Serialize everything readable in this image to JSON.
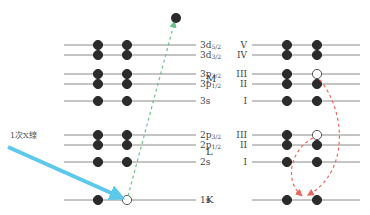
{
  "xray_label": "1次X線",
  "left_levels": [
    {
      "id": "3d52",
      "base": "3d",
      "sub": "5/2",
      "y": 45,
      "electrons": [
        "filled",
        "filled"
      ]
    },
    {
      "id": "3d32",
      "base": "3d",
      "sub": "3/2",
      "y": 55,
      "electrons": [
        "filled",
        "filled"
      ]
    },
    {
      "id": "3p32",
      "base": "3p",
      "sub": "3/2",
      "y": 74,
      "electrons": [
        "filled",
        "filled"
      ]
    },
    {
      "id": "3p12",
      "base": "3p",
      "sub": "1/2",
      "y": 84,
      "electrons": [
        "filled",
        "filled"
      ]
    },
    {
      "id": "3s",
      "base": "3s",
      "sub": "",
      "y": 101,
      "electrons": [
        "filled",
        "filled"
      ]
    },
    {
      "id": "2p32",
      "base": "2p",
      "sub": "3/2",
      "y": 135,
      "electrons": [
        "filled",
        "filled"
      ]
    },
    {
      "id": "2p12",
      "base": "2p",
      "sub": "1/2",
      "y": 145,
      "electrons": [
        "filled",
        "filled"
      ]
    },
    {
      "id": "2s",
      "base": "2s",
      "sub": "",
      "y": 162,
      "electrons": [
        "filled",
        "filled"
      ]
    },
    {
      "id": "1s",
      "base": "1s",
      "sub": "",
      "y": 200,
      "electrons": [
        "filled",
        "hole"
      ]
    }
  ],
  "shells": [
    {
      "label": "M",
      "y": 79
    },
    {
      "label": "L",
      "y": 152
    },
    {
      "label": "K",
      "y": 200
    }
  ],
  "right_levels": [
    {
      "roman": "V",
      "y": 45,
      "electrons": [
        "filled",
        "filled"
      ]
    },
    {
      "roman": "IV",
      "y": 55,
      "electrons": [
        "filled",
        "filled"
      ]
    },
    {
      "roman": "III",
      "y": 74,
      "electrons": [
        "filled",
        "hole"
      ]
    },
    {
      "roman": "II",
      "y": 84,
      "electrons": [
        "filled",
        "filled"
      ]
    },
    {
      "roman": "I",
      "y": 101,
      "electrons": [
        "filled",
        "filled"
      ]
    },
    {
      "roman": "III",
      "y": 135,
      "electrons": [
        "filled",
        "hole"
      ]
    },
    {
      "roman": "II",
      "y": 145,
      "electrons": [
        "filled",
        "filled"
      ]
    },
    {
      "roman": "I",
      "y": 162,
      "electrons": [
        "filled",
        "filled"
      ]
    },
    {
      "roman": "",
      "y": 200,
      "electrons": [
        "filled",
        "filled"
      ]
    }
  ],
  "colors": {
    "line": "#8a8a8a",
    "electron": "#2b2b2b",
    "xray": "#5bc8ec",
    "photoelectron_path": "#6cc08a",
    "transition": "#e8675a"
  }
}
